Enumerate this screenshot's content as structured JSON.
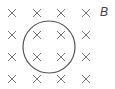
{
  "diagram": {
    "field_label": "B",
    "field_symbol": "×",
    "grid": {
      "columns_x": [
        12,
        37,
        61,
        86
      ],
      "rows_y": [
        13,
        35,
        57,
        79
      ]
    },
    "loop": {
      "cx": 49,
      "cy": 47,
      "r": 26
    },
    "colors": {
      "stroke": "#555555",
      "cross": "#777777"
    }
  }
}
